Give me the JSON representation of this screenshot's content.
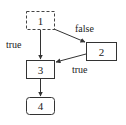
{
  "diagram": {
    "nodes": [
      {
        "id": "1",
        "label": "1",
        "style": "dashed"
      },
      {
        "id": "2",
        "label": "2",
        "style": "solid"
      },
      {
        "id": "3",
        "label": "3",
        "style": "solid"
      },
      {
        "id": "4",
        "label": "4",
        "style": "rounded"
      }
    ],
    "edges": [
      {
        "from": "1",
        "to": "3",
        "label": "true"
      },
      {
        "from": "1",
        "to": "2",
        "label": "false"
      },
      {
        "from": "2",
        "to": "3",
        "label": "true"
      },
      {
        "from": "3",
        "to": "4",
        "label": ""
      }
    ],
    "colors": {
      "stroke": "#333333",
      "text": "#222222",
      "background": "#ffffff"
    }
  }
}
